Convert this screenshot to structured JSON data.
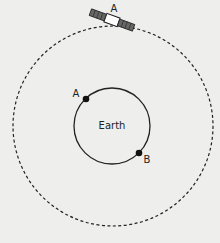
{
  "diagram": {
    "background": "#eeeeec",
    "satellite": {
      "label": "A",
      "orbit_style": "dashed"
    },
    "earth": {
      "label": "Earth",
      "points": [
        {
          "label": "A"
        },
        {
          "label": "B"
        }
      ]
    }
  }
}
